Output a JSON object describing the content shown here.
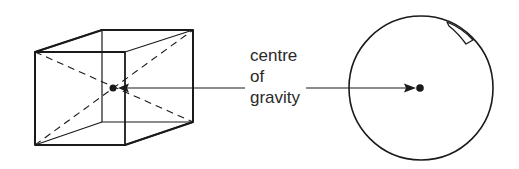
{
  "diagram": {
    "label_lines": [
      "centre",
      "of",
      "gravity"
    ],
    "colors": {
      "stroke": "#1a1a1a",
      "text": "#2a2a2a",
      "background": "#ffffff"
    },
    "shapes": [
      {
        "type": "cube",
        "description": "wireframe cube with dashed space diagonals meeting at centre of gravity"
      },
      {
        "type": "circle",
        "description": "disc/wheel with small rectangular notch near top right rim, centre of gravity dot at center"
      }
    ]
  }
}
